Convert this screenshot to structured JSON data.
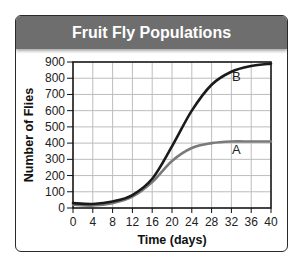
{
  "chart_data": {
    "type": "line",
    "title": "Fruit Fly Populations",
    "xlabel": "Time (days)",
    "ylabel": "Number of Flies",
    "x": [
      0,
      4,
      8,
      12,
      16,
      20,
      24,
      28,
      32,
      36,
      40
    ],
    "xticks": [
      0,
      4,
      8,
      12,
      16,
      20,
      24,
      28,
      32,
      36,
      40
    ],
    "yticks": [
      0,
      100,
      200,
      300,
      400,
      500,
      600,
      700,
      800,
      900
    ],
    "xlim": [
      0,
      40
    ],
    "ylim": [
      0,
      900
    ],
    "grid": true,
    "legend": "inline labels",
    "series": [
      {
        "name": "A",
        "color": "#7a7a7a",
        "values": [
          20,
          15,
          30,
          70,
          160,
          290,
          370,
          400,
          410,
          410,
          410
        ]
      },
      {
        "name": "B",
        "color": "#1a1a1a",
        "values": [
          30,
          25,
          40,
          80,
          180,
          380,
          600,
          760,
          840,
          875,
          890
        ]
      }
    ],
    "annotations": [
      {
        "text": "B",
        "x": 33,
        "y": 780
      },
      {
        "text": "A",
        "x": 33,
        "y": 330
      }
    ]
  },
  "colors": {
    "header_bg": "#6e6e6e",
    "header_text": "#ffffff",
    "grid": "#bdbdbd",
    "axis": "#111111"
  }
}
